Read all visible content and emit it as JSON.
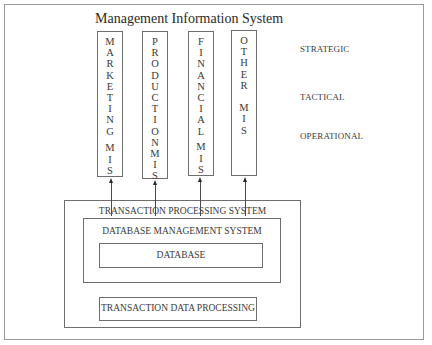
{
  "caption_fragment": "Figure 1. Management Information System",
  "diagram": {
    "title": "Management Information System",
    "mis_boxes": [
      {
        "id": "marketing",
        "letters": [
          "M",
          "A",
          "R",
          "K",
          "E",
          "T",
          "I",
          "N",
          "G",
          "",
          "M",
          "I",
          "S"
        ]
      },
      {
        "id": "production",
        "letters": [
          "P",
          "R",
          "O",
          "D",
          "U",
          "C",
          "T",
          "I",
          "O",
          "N",
          "",
          "M",
          "I",
          "S"
        ]
      },
      {
        "id": "financial",
        "letters": [
          "F",
          "I",
          "N",
          "A",
          "N",
          "C",
          "I",
          "A",
          "L",
          "",
          "M",
          "I",
          "S"
        ]
      },
      {
        "id": "other",
        "letters": [
          "O",
          "T",
          "H",
          "E",
          "R",
          "",
          "M",
          "I",
          "S"
        ]
      }
    ],
    "levels": {
      "strategic": "STRATEGIC",
      "tactical": "TACTICAL",
      "operational": "OPERATIONAL"
    },
    "tps": {
      "label": "TRANSACTION PROCESSING SYSTEM",
      "dbms": {
        "label": "DATABASE MANAGEMENT SYSTEM",
        "database": {
          "label": "DATABASE"
        }
      },
      "tdp": {
        "label": "TRANSACTION DATA PROCESSING"
      }
    },
    "colors": {
      "stroke": "#6e6e6e",
      "text": "#3a3a3a",
      "frame": "#9a9a9a"
    }
  }
}
